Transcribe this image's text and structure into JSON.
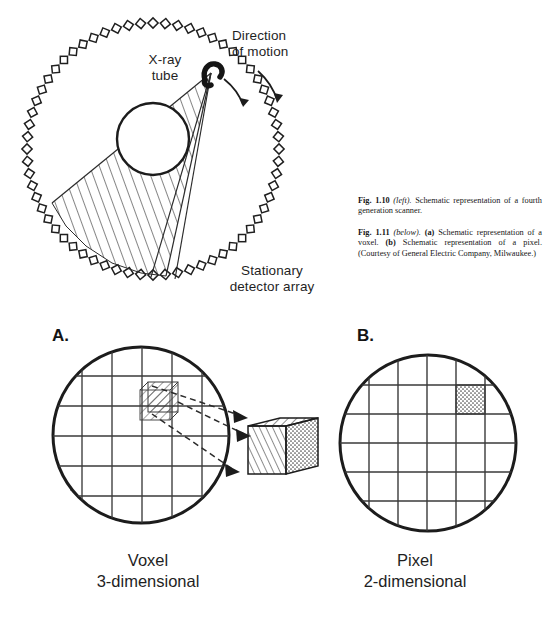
{
  "figure": {
    "scanner": {
      "label_xray_tube": "X-ray\ntube",
      "label_direction": "Direction\nof motion",
      "label_detector_array": "Stationary\ndetector array",
      "detector_count": 64,
      "icon_xray_tube": "xray-tube-icon",
      "icon_rotation_arrow": "curved-arrow-icon"
    },
    "captions": [
      {
        "fig_number": "Fig. 1.10",
        "position_note": "(left).",
        "text": " Schematic representation of a fourth generation scanner."
      },
      {
        "fig_number": "Fig. 1.11",
        "position_note": "(below).",
        "part_a": "(a)",
        "text_a": " Schematic representation of a voxel. ",
        "part_b": "(b)",
        "text_b": " Schematic representation of a pixel. (Courtesy of General Electric Company, Milwaukee.)"
      }
    ],
    "panels": [
      {
        "letter": "A.",
        "title": "Voxel",
        "subtitle": "3-dimensional",
        "grid_rows": 5,
        "grid_cols": 5,
        "highlight_fill": "hatched",
        "callout_shape": "cube"
      },
      {
        "letter": "B.",
        "title": "Pixel",
        "subtitle": "2-dimensional",
        "grid_rows": 5,
        "grid_cols": 5,
        "highlight_fill": "stippled",
        "callout_shape": "square"
      }
    ]
  },
  "colors": {
    "ink": "#1a1a1a",
    "line": "#3a3a3a",
    "background": "#ffffff",
    "hatch": "#2b2b2b",
    "stipple": "#555555"
  }
}
